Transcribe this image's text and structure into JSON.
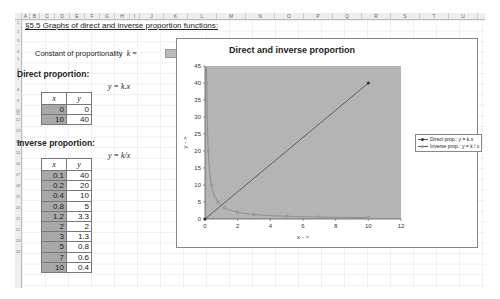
{
  "spreadsheet": {
    "columns": [
      "A",
      "B",
      "C",
      "D",
      "E",
      "F",
      "G",
      "H",
      "I",
      "J",
      "K",
      "L",
      "M",
      "N",
      "O",
      "P",
      "Q",
      "R",
      "S",
      "T",
      "U"
    ],
    "rows": [
      "1",
      "2",
      "3",
      "4",
      "5",
      "6",
      "7",
      "8",
      "9",
      "10",
      "11",
      "12",
      "13",
      "14",
      "15",
      "16",
      "17",
      "18",
      "19",
      "20",
      "21",
      "22",
      "23",
      "24"
    ]
  },
  "title": "§5.5  Graphs of direct and inverse proportion functions:",
  "constant": {
    "label": "Constant of proportionality",
    "symbol": "k =",
    "value": "4"
  },
  "direct": {
    "heading": "Direct proportion:",
    "formula": "y = k.x",
    "headers": [
      "x",
      "y"
    ],
    "rows": [
      [
        "0",
        "0"
      ],
      [
        "10",
        "40"
      ]
    ]
  },
  "inverse": {
    "heading": "Inverse proportion:",
    "formula": "y = k/x",
    "headers": [
      "x",
      "y"
    ],
    "rows": [
      [
        "0.1",
        "40"
      ],
      [
        "0.2",
        "20"
      ],
      [
        "0.4",
        "10"
      ],
      [
        "0.8",
        "5"
      ],
      [
        "1.2",
        "3.3"
      ],
      [
        "2",
        "2"
      ],
      [
        "3",
        "1.3"
      ],
      [
        "5",
        "0.8"
      ],
      [
        "7",
        "0.6"
      ],
      [
        "10",
        "0.4"
      ]
    ]
  },
  "chart": {
    "title": "Direct and inverse proportion",
    "xlabel": "x - >",
    "ylabel": "y - >",
    "legend": [
      "Direct prop.: y = k.x",
      "Inverse prop.: y = k / x"
    ],
    "plot_bg": "#b4b4b4"
  },
  "chart_data": {
    "type": "scatter",
    "title": "Direct and inverse proportion",
    "xlabel": "x - >",
    "ylabel": "y - >",
    "xlim": [
      0,
      12
    ],
    "ylim": [
      0,
      45
    ],
    "xticks": [
      0,
      2,
      4,
      6,
      8,
      10,
      12
    ],
    "yticks": [
      0,
      5,
      10,
      15,
      20,
      25,
      30,
      35,
      40,
      45
    ],
    "legend_position": "right",
    "grid": false,
    "series": [
      {
        "name": "Direct prop.: y = k.x",
        "x": [
          0,
          10
        ],
        "y": [
          0,
          40
        ]
      },
      {
        "name": "Inverse prop.: y = k / x",
        "x": [
          0.1,
          0.2,
          0.4,
          0.8,
          1.2,
          2,
          3,
          5,
          7,
          10
        ],
        "y": [
          40,
          20,
          10,
          5,
          3.3,
          2,
          1.3,
          0.8,
          0.6,
          0.4
        ]
      }
    ]
  }
}
